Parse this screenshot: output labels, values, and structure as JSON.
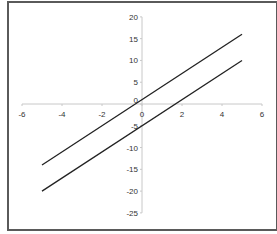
{
  "chart_data": {
    "type": "line",
    "title": "",
    "xlabel": "",
    "ylabel": "",
    "xlim": [
      -6,
      6
    ],
    "ylim": [
      -25,
      20
    ],
    "x_ticks": [
      -6,
      -4,
      -2,
      0,
      2,
      4,
      6
    ],
    "y_ticks": [
      20,
      15,
      10,
      5,
      0,
      -5,
      -10,
      -15,
      -20,
      -25
    ],
    "grid": false,
    "legend": null,
    "series": [
      {
        "name": "y = 3x + 1",
        "x": [
          -5,
          5
        ],
        "y": [
          -14,
          16
        ]
      },
      {
        "name": "y = 3x - 5",
        "x": [
          -5,
          5
        ],
        "y": [
          -20,
          10
        ]
      }
    ]
  },
  "style": {
    "axis_color": "#c8c8c8",
    "line_color": "#222222",
    "frame_color": "#5a5a5a"
  }
}
